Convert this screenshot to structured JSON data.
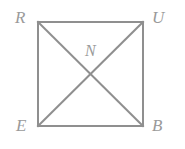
{
  "figure": {
    "type": "geometry-diagram",
    "shape_name": "square",
    "background_color": "#ffffff",
    "stroke_color": "#8f8f8f",
    "label_color": "#9a9a9a",
    "stroke_width": 2,
    "square": {
      "x": 38,
      "y": 22,
      "width": 105,
      "height": 104
    },
    "vertices": [
      {
        "id": "R",
        "label": "R",
        "position": "top-left",
        "x": 38,
        "y": 22
      },
      {
        "id": "U",
        "label": "U",
        "position": "top-right",
        "x": 143,
        "y": 22
      },
      {
        "id": "B",
        "label": "B",
        "position": "bottom-right",
        "x": 143,
        "y": 126
      },
      {
        "id": "E",
        "label": "E",
        "position": "bottom-left",
        "x": 38,
        "y": 126
      }
    ],
    "interior_points": [
      {
        "id": "N",
        "label": "N",
        "position": "center",
        "x": 90.5,
        "y": 74
      }
    ],
    "segments": [
      {
        "id": "RU",
        "from": "R",
        "to": "U",
        "kind": "side"
      },
      {
        "id": "UB",
        "from": "U",
        "to": "B",
        "kind": "side"
      },
      {
        "id": "BE",
        "from": "B",
        "to": "E",
        "kind": "side"
      },
      {
        "id": "ER",
        "from": "E",
        "to": "R",
        "kind": "side"
      },
      {
        "id": "RB",
        "from": "R",
        "to": "B",
        "kind": "diagonal"
      },
      {
        "id": "UE",
        "from": "U",
        "to": "E",
        "kind": "diagonal"
      }
    ]
  }
}
